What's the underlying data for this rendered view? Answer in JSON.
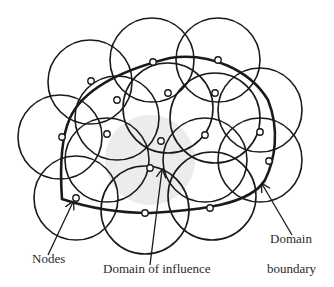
{
  "figure": {
    "type": "meshless-method schematic",
    "labels": {
      "nodes": "Nodes",
      "domain_of_influence": "Domain of influence",
      "domain_boundary_line1": "Domain",
      "domain_boundary_line2": "boundary"
    },
    "colors": {
      "stroke": "#1a1a1a",
      "shaded_domain": "#ececec",
      "node_fill": "#ffffff",
      "text": "#2a2a2a"
    }
  },
  "diagram": {
    "influence_circles": [
      {
        "cx": 90,
        "cy": 82,
        "r": 42
      },
      {
        "cx": 152,
        "cy": 60,
        "r": 42
      },
      {
        "cx": 218,
        "cy": 60,
        "r": 42
      },
      {
        "cx": 60,
        "cy": 137,
        "r": 42
      },
      {
        "cx": 117,
        "cy": 118,
        "r": 42
      },
      {
        "cx": 168,
        "cy": 108,
        "r": 45
      },
      {
        "cx": 215,
        "cy": 118,
        "r": 45
      },
      {
        "cx": 260,
        "cy": 110,
        "r": 42
      },
      {
        "cx": 107,
        "cy": 160,
        "r": 42
      },
      {
        "cx": 205,
        "cy": 160,
        "r": 42
      },
      {
        "cx": 260,
        "cy": 160,
        "r": 42
      },
      {
        "cx": 76,
        "cy": 198,
        "r": 42
      },
      {
        "cx": 145,
        "cy": 210,
        "r": 44
      },
      {
        "cx": 212,
        "cy": 196,
        "r": 44
      }
    ],
    "shaded_circle": {
      "cx": 150,
      "cy": 160,
      "r": 45
    },
    "nodes": [
      {
        "x": 91,
        "y": 81
      },
      {
        "x": 153,
        "y": 62
      },
      {
        "x": 218,
        "y": 60
      },
      {
        "x": 117,
        "y": 100
      },
      {
        "x": 168,
        "y": 93
      },
      {
        "x": 215,
        "y": 93
      },
      {
        "x": 62,
        "y": 137
      },
      {
        "x": 107,
        "y": 134
      },
      {
        "x": 161,
        "y": 141
      },
      {
        "x": 205,
        "y": 135
      },
      {
        "x": 260,
        "y": 132
      },
      {
        "x": 150,
        "y": 168
      },
      {
        "x": 269,
        "y": 161
      },
      {
        "x": 76,
        "y": 198
      },
      {
        "x": 145,
        "y": 213
      },
      {
        "x": 210,
        "y": 208
      }
    ],
    "boundary_path": "M 62 199 C 60 170, 60 140, 70 118 C 85 85, 130 68, 170 58 C 210 52, 250 70, 268 100 C 280 130, 275 160, 265 180 C 250 205, 200 210, 150 213 C 110 213, 80 205, 62 199 Z",
    "arrows": {
      "nodes": {
        "x1": 48,
        "y1": 255,
        "x2": 73,
        "y2": 202
      },
      "domain_of_influence": {
        "x1": 150,
        "y1": 265,
        "x2": 162,
        "y2": 170
      },
      "domain_boundary": {
        "x1": 292,
        "y1": 235,
        "x2": 262,
        "y2": 184
      }
    }
  }
}
